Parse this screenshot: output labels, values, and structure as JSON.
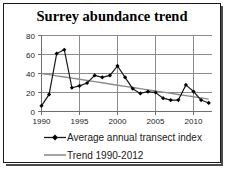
{
  "chart_data": {
    "type": "line",
    "title": "Surrey abundance trend",
    "xlabel": "",
    "ylabel": "",
    "xlim": [
      1990,
      2012
    ],
    "ylim": [
      0,
      80
    ],
    "ytick_labels": [
      "0",
      "20",
      "40",
      "60",
      "80"
    ],
    "ytick_values": [
      0,
      20,
      40,
      60,
      80
    ],
    "xtick_labels": [
      "1990",
      "1995",
      "2000",
      "2005",
      "2010"
    ],
    "xtick_values": [
      1990,
      1995,
      2000,
      2005,
      2010
    ],
    "grid": "horizontal-and-vertical",
    "legend_position": "below",
    "x": [
      1990,
      1991,
      1992,
      1993,
      1994,
      1995,
      1996,
      1997,
      1998,
      1999,
      2000,
      2001,
      2002,
      2003,
      2004,
      2005,
      2006,
      2007,
      2008,
      2009,
      2010,
      2011,
      2012
    ],
    "series": [
      {
        "name": "Average annual transect index",
        "type": "line-markers",
        "color": "#000000",
        "marker": "diamond",
        "values": [
          6,
          18,
          61,
          65,
          25,
          27,
          30,
          38,
          36,
          38,
          48,
          36,
          24,
          19,
          21,
          20,
          14,
          12,
          12,
          28,
          21,
          12,
          9
        ]
      },
      {
        "name": "Trend 1990-2012",
        "type": "line",
        "color": "#8c8c8c",
        "marker": "none",
        "values": [
          40,
          38.8,
          37.5,
          36.3,
          35.1,
          33.9,
          32.6,
          31.4,
          30.2,
          29.0,
          27.7,
          26.5,
          25.3,
          24.1,
          22.8,
          21.6,
          20.4,
          19.2,
          17.9,
          16.7,
          15.5,
          14.3,
          13.0
        ]
      }
    ],
    "legend": [
      {
        "label": "Average annual transect index",
        "color": "#000000",
        "marker": "diamond"
      },
      {
        "label": "Trend 1990-2012",
        "color": "#8c8c8c",
        "marker": "none"
      }
    ],
    "colors": {
      "series_primary": "#000000",
      "series_trend": "#8c8c8c",
      "grid": "#8c8c8c",
      "axis": "#6e6e6e",
      "frame_border": "#1a1a1a",
      "background": "#ffffff"
    }
  }
}
